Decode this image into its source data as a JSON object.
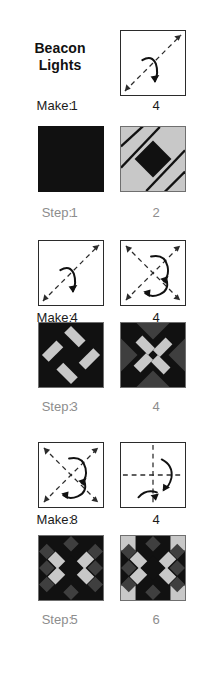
{
  "title": {
    "line1": "Beacon",
    "line2": "Lights"
  },
  "labels": {
    "make": "Make:",
    "step": "Step:"
  },
  "colors": {
    "background": "#ffffff",
    "ink": "#1a1a1a",
    "step_label": "#8d8d8d",
    "fabric_black": "#111111",
    "fabric_dark_gray": "#3f3f3f",
    "fabric_light_gray": "#c8c8c8",
    "block_border": "#6f6f6f",
    "diagram_line": "#2b2b2b"
  },
  "rows": [
    {
      "kind": "diagram",
      "caption_label": "Make:",
      "caption_style": "make",
      "left": {
        "name": "fold-diagonal-single",
        "count": "1"
      },
      "right": {
        "name": "fold-diagonal-single",
        "count": "4"
      }
    },
    {
      "kind": "block",
      "caption_label": "Step:",
      "caption_style": "step",
      "left": {
        "name": "solid-black-square",
        "count": "1"
      },
      "right": {
        "name": "gray-square-black-diamond",
        "count": "2"
      }
    },
    {
      "kind": "diagram",
      "caption_label": "Make:",
      "caption_style": "make",
      "left": {
        "name": "fold-diagonal-single",
        "count": "4"
      },
      "right": {
        "name": "fold-double-diagonal",
        "count": "4"
      }
    },
    {
      "kind": "block",
      "caption_label": "Step:",
      "caption_style": "step",
      "left": {
        "name": "black-block-gray-diamond-ring",
        "count": "3"
      },
      "right": {
        "name": "black-block-gray-diamonds-dark-triangles",
        "count": "4"
      }
    },
    {
      "kind": "diagram",
      "caption_label": "Make:",
      "caption_style": "make",
      "left": {
        "name": "fold-double-diagonal",
        "count": "8"
      },
      "right": {
        "name": "fold-cross-straight",
        "count": "4"
      }
    },
    {
      "kind": "block",
      "caption_label": "Step:",
      "caption_style": "step",
      "left": {
        "name": "quilt-block-no-corners",
        "count": "5"
      },
      "right": {
        "name": "quilt-block-with-corners",
        "count": "6"
      }
    }
  ]
}
